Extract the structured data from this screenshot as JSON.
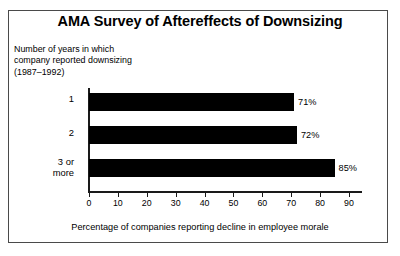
{
  "figure": {
    "title": "AMA Survey of Aftereffects of Downsizing",
    "caption_lines": [
      "Number of years in which",
      "company reported downsizing",
      "(1987–1992)"
    ],
    "border_color": "#4a4a4a",
    "bar_color": "#000000"
  },
  "chart_data": {
    "type": "bar",
    "orientation": "horizontal",
    "title": "AMA Survey of Aftereffects of Downsizing",
    "categories": [
      "1",
      "2",
      "3 or more"
    ],
    "category_label_lines": [
      [
        "1"
      ],
      [
        "2"
      ],
      [
        "3 or",
        "more"
      ]
    ],
    "values": [
      71,
      72,
      85
    ],
    "value_labels": [
      "71%",
      "72%",
      "85%"
    ],
    "xlabel": "Percentage of companies reporting decline in employee morale",
    "ylabel": "Number of years in which company reported downsizing (1987–1992)",
    "xlim": [
      0,
      90
    ],
    "xticks": [
      0,
      10,
      20,
      30,
      40,
      50,
      60,
      70,
      80,
      90
    ],
    "xtick_labels": [
      "0",
      "10",
      "20",
      "30",
      "40",
      "50",
      "60",
      "70",
      "80",
      "90"
    ],
    "grid": false,
    "legend": null
  }
}
